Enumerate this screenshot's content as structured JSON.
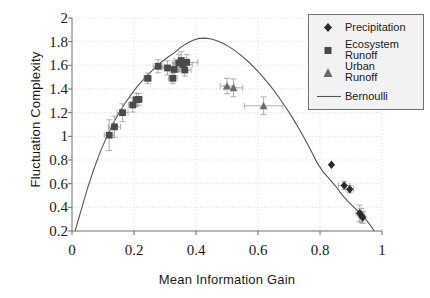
{
  "chart_data": {
    "type": "scatter",
    "title": "",
    "xlabel": "Mean Information Gain",
    "ylabel": "Fluctuation Complexity",
    "xlim": [
      0,
      1
    ],
    "ylim": [
      0.2,
      2
    ],
    "xticks": [
      "0",
      "0.2",
      "0.4",
      "0.6",
      "0.8",
      "1"
    ],
    "xtick_values": [
      0,
      0.2,
      0.4,
      0.6,
      0.8,
      1
    ],
    "yticks": [
      "0.2",
      "0.4",
      "0.6",
      "0.8",
      "1",
      "1.2",
      "1.4",
      "1.6",
      "1.8",
      "2"
    ],
    "ytick_values": [
      0.2,
      0.4,
      0.6,
      0.8,
      1.0,
      1.2,
      1.4,
      1.6,
      1.8,
      2.0
    ],
    "grid": "dotted",
    "legend_position": "top-right",
    "series": [
      {
        "name": "Precipitation",
        "marker": "diamond",
        "color": "#2b2b2b",
        "points": [
          {
            "x": 0.837,
            "y": 0.76,
            "xerr": 0.0,
            "yerr": 0.0
          },
          {
            "x": 0.878,
            "y": 0.585,
            "xerr": 0.018,
            "yerr": 0.035
          },
          {
            "x": 0.896,
            "y": 0.553,
            "xerr": 0.012,
            "yerr": 0.03
          },
          {
            "x": 0.928,
            "y": 0.35,
            "xerr": 0.012,
            "yerr": 0.07
          },
          {
            "x": 0.933,
            "y": 0.33,
            "xerr": 0.01,
            "yerr": 0.06
          },
          {
            "x": 0.938,
            "y": 0.315,
            "xerr": 0.01,
            "yerr": 0.05
          }
        ]
      },
      {
        "name": "Ecosystem Runoff",
        "marker": "square",
        "color": "#4a4a4a",
        "points": [
          {
            "x": 0.12,
            "y": 1.01,
            "xerr": 0.016,
            "yerr": 0.13
          },
          {
            "x": 0.137,
            "y": 1.08,
            "xerr": 0.02,
            "yerr": 0.09
          },
          {
            "x": 0.163,
            "y": 1.2,
            "xerr": 0.018,
            "yerr": 0.075
          },
          {
            "x": 0.196,
            "y": 1.265,
            "xerr": 0.014,
            "yerr": 0.06
          },
          {
            "x": 0.208,
            "y": 1.31,
            "xerr": 0.012,
            "yerr": 0.055
          },
          {
            "x": 0.215,
            "y": 1.312,
            "xerr": 0.012,
            "yerr": 0.05
          },
          {
            "x": 0.244,
            "y": 1.49,
            "xerr": 0.012,
            "yerr": 0.045
          },
          {
            "x": 0.278,
            "y": 1.592,
            "xerr": 0.016,
            "yerr": 0.055
          },
          {
            "x": 0.308,
            "y": 1.578,
            "xerr": 0.018,
            "yerr": 0.06
          },
          {
            "x": 0.325,
            "y": 1.49,
            "xerr": 0.014,
            "yerr": 0.045
          },
          {
            "x": 0.33,
            "y": 1.565,
            "xerr": 0.016,
            "yerr": 0.055
          },
          {
            "x": 0.345,
            "y": 1.62,
            "xerr": 0.02,
            "yerr": 0.07
          },
          {
            "x": 0.352,
            "y": 1.64,
            "xerr": 0.022,
            "yerr": 0.075
          },
          {
            "x": 0.358,
            "y": 1.605,
            "xerr": 0.03,
            "yerr": 0.06
          },
          {
            "x": 0.364,
            "y": 1.56,
            "xerr": 0.02,
            "yerr": 0.05
          },
          {
            "x": 0.37,
            "y": 1.625,
            "xerr": 0.036,
            "yerr": 0.065
          }
        ]
      },
      {
        "name": "Urban Runoff",
        "marker": "triangle",
        "color": "#6b6b6b",
        "points": [
          {
            "x": 0.5,
            "y": 1.425,
            "xerr": 0.022,
            "yerr": 0.065
          },
          {
            "x": 0.521,
            "y": 1.41,
            "xerr": 0.03,
            "yerr": 0.075
          },
          {
            "x": 0.618,
            "y": 1.258,
            "xerr": 0.062,
            "yerr": 0.075
          }
        ]
      }
    ],
    "curve": {
      "name": "Bernoulli",
      "style": "solid",
      "color": "#555555",
      "description": "Bernoulli fluctuation-complexity upper-bound curve peaking near x=0.41, y=1.83",
      "points": [
        {
          "x": 0.01,
          "y": 0.2
        },
        {
          "x": 0.03,
          "y": 0.38
        },
        {
          "x": 0.05,
          "y": 0.56
        },
        {
          "x": 0.07,
          "y": 0.72
        },
        {
          "x": 0.09,
          "y": 0.86
        },
        {
          "x": 0.11,
          "y": 0.985
        },
        {
          "x": 0.13,
          "y": 1.095
        },
        {
          "x": 0.15,
          "y": 1.19
        },
        {
          "x": 0.17,
          "y": 1.275
        },
        {
          "x": 0.19,
          "y": 1.35
        },
        {
          "x": 0.21,
          "y": 1.42
        },
        {
          "x": 0.23,
          "y": 1.48
        },
        {
          "x": 0.25,
          "y": 1.535
        },
        {
          "x": 0.27,
          "y": 1.585
        },
        {
          "x": 0.29,
          "y": 1.63
        },
        {
          "x": 0.31,
          "y": 1.67
        },
        {
          "x": 0.33,
          "y": 1.705
        },
        {
          "x": 0.35,
          "y": 1.752
        },
        {
          "x": 0.37,
          "y": 1.785
        },
        {
          "x": 0.39,
          "y": 1.812
        },
        {
          "x": 0.41,
          "y": 1.828
        },
        {
          "x": 0.43,
          "y": 1.83
        },
        {
          "x": 0.45,
          "y": 1.822
        },
        {
          "x": 0.47,
          "y": 1.806
        },
        {
          "x": 0.49,
          "y": 1.782
        },
        {
          "x": 0.51,
          "y": 1.752
        },
        {
          "x": 0.53,
          "y": 1.716
        },
        {
          "x": 0.55,
          "y": 1.674
        },
        {
          "x": 0.57,
          "y": 1.628
        },
        {
          "x": 0.59,
          "y": 1.576
        },
        {
          "x": 0.61,
          "y": 1.52
        },
        {
          "x": 0.63,
          "y": 1.458
        },
        {
          "x": 0.65,
          "y": 1.392
        },
        {
          "x": 0.67,
          "y": 1.32
        },
        {
          "x": 0.69,
          "y": 1.244
        },
        {
          "x": 0.71,
          "y": 1.162
        },
        {
          "x": 0.73,
          "y": 1.075
        },
        {
          "x": 0.75,
          "y": 0.982
        },
        {
          "x": 0.77,
          "y": 0.884
        },
        {
          "x": 0.79,
          "y": 0.78
        },
        {
          "x": 0.81,
          "y": 0.7
        },
        {
          "x": 0.83,
          "y": 0.64
        },
        {
          "x": 0.85,
          "y": 0.58
        },
        {
          "x": 0.87,
          "y": 0.51
        },
        {
          "x": 0.89,
          "y": 0.45
        },
        {
          "x": 0.91,
          "y": 0.4
        },
        {
          "x": 0.93,
          "y": 0.35
        },
        {
          "x": 0.95,
          "y": 0.29
        },
        {
          "x": 0.965,
          "y": 0.24
        },
        {
          "x": 0.975,
          "y": 0.2
        }
      ]
    }
  },
  "legend": {
    "items": [
      {
        "label_line1": "Precipitation",
        "label_line2": "",
        "key": "diamond-marker"
      },
      {
        "label_line1": "Ecosystem",
        "label_line2": "Runoff",
        "key": "square-marker"
      },
      {
        "label_line1": "Urban",
        "label_line2": "Runoff",
        "key": "triangle-marker"
      },
      {
        "label_line1": "Bernoulli",
        "label_line2": "",
        "key": "line-swatch"
      }
    ]
  },
  "colors": {
    "axis": "#6f6f6f",
    "grid": "#c8c8c8",
    "errorbar": "#9a9a9a",
    "legend_background": "#f2f2f2",
    "legend_border": "#6f6f6f",
    "precipitation": "#2b2b2b",
    "ecosystem": "#4a4a4a",
    "urban": "#6b6b6b",
    "bernoulli": "#555555"
  }
}
